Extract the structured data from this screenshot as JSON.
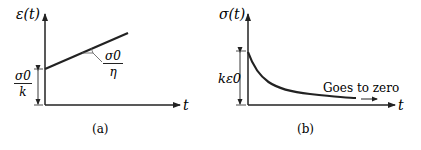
{
  "panel_a": {
    "y_label": "ε(t)",
    "x_label": "t",
    "jump_label_num": "σ0",
    "jump_label_den": "k",
    "slope_label_num": "σ0",
    "slope_label_den": "η",
    "caption": "(a)"
  },
  "panel_b": {
    "y_label": "σ(t)",
    "x_label": "t",
    "jump_label": "kε0",
    "annotation": "Goes to zero",
    "caption": "(b)"
  }
}
